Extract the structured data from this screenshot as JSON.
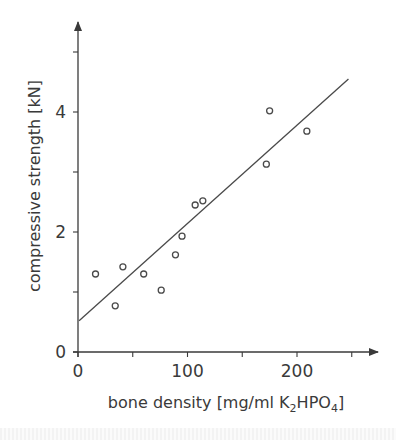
{
  "chart_data": {
    "type": "scatter",
    "title": "",
    "xlabel": "bone density [mg/ml K2HPO4]",
    "xlabel_parts": {
      "pre": "bone density [mg/ml K",
      "sub1": "2",
      "mid": "HPO",
      "sub2": "4",
      "post": "]"
    },
    "ylabel": "compressive strength [kN]",
    "xlim": [
      0,
      260
    ],
    "ylim": [
      0,
      5.5
    ],
    "x_ticks": [
      0,
      50,
      100,
      150,
      200,
      250
    ],
    "x_tick_labels": [
      "0",
      "100",
      "200"
    ],
    "x_tick_label_values": [
      0,
      100,
      200
    ],
    "y_ticks": [
      0,
      1,
      2,
      3,
      4,
      5
    ],
    "y_tick_labels": [
      "0",
      "2",
      "4"
    ],
    "y_tick_label_values": [
      0,
      2,
      4
    ],
    "grid": false,
    "legend": null,
    "series": [
      {
        "name": "measurements",
        "marker": "open-circle",
        "points": [
          {
            "x": 16,
            "y": 1.3
          },
          {
            "x": 34,
            "y": 0.77
          },
          {
            "x": 41,
            "y": 1.42
          },
          {
            "x": 60,
            "y": 1.3
          },
          {
            "x": 76,
            "y": 1.03
          },
          {
            "x": 89,
            "y": 1.62
          },
          {
            "x": 95,
            "y": 1.93
          },
          {
            "x": 107,
            "y": 2.45
          },
          {
            "x": 114,
            "y": 2.52
          },
          {
            "x": 172,
            "y": 3.13
          },
          {
            "x": 175,
            "y": 4.02
          },
          {
            "x": 209,
            "y": 3.68
          }
        ]
      }
    ],
    "fit_line": {
      "type": "linear-regression",
      "start": {
        "x": 1,
        "y": 0.52
      },
      "end": {
        "x": 247,
        "y": 4.55
      }
    }
  },
  "colors": {
    "axis": "#3a3a3a",
    "marker": "#4a4a4a",
    "background": "#ffffff"
  }
}
